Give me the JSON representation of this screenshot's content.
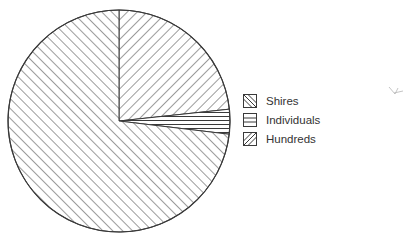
{
  "chart_data": {
    "type": "pie",
    "title": "",
    "categories": [
      "Shires",
      "Individuals",
      "Hundreds"
    ],
    "values": [
      23.3,
      3.6,
      73.1
    ],
    "unit": "percent (estimated from slice angles)",
    "start_angle_deg": 90,
    "direction": "clockwise",
    "patterns": {
      "Shires": "diagonal-backslash-hatch",
      "Individuals": "horizontal-lines",
      "Hundreds": "diagonal-forward-slash-hatch"
    },
    "legend": {
      "position": "right",
      "entries": [
        "Shires",
        "Individuals",
        "Hundreds"
      ]
    },
    "colors": {
      "line": "#3a3a3a",
      "background": "#ffffff",
      "text": "#333333"
    }
  },
  "legend": {
    "items": [
      {
        "label": "Shires",
        "pattern": "diagonal-backslash-hatch"
      },
      {
        "label": "Individuals",
        "pattern": "horizontal-lines"
      },
      {
        "label": "Hundreds",
        "pattern": "diagonal-forward-slash-hatch"
      }
    ]
  },
  "annotation": {
    "icon": "stray-pencil-mark-icon"
  }
}
